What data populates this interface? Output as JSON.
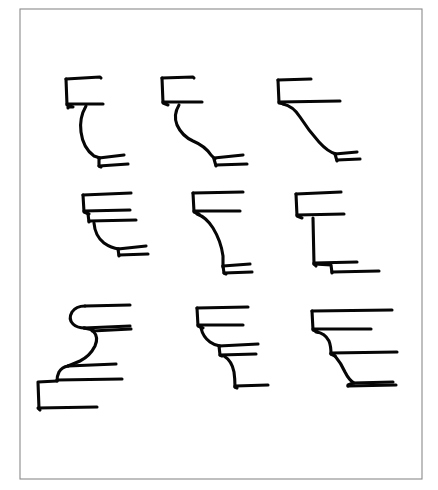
{
  "document": {
    "kind": "line-drawing-plate",
    "title": "",
    "background_color": "#ffffff",
    "ink_color": "#060606",
    "frame_color": "#8a8a8a"
  },
  "frame": {
    "x": 20,
    "y": 9,
    "width": 402,
    "height": 470,
    "stroke_width": 1.1,
    "label": "plate-border"
  },
  "plate": {
    "columns": 3,
    "rows": 3,
    "figure_count": 9,
    "subject": "architectural cornice and bracket moulding profiles",
    "caption": ""
  },
  "figures": [
    {
      "id": "profile-1",
      "row": 1,
      "column": 1,
      "name": "cavetto-cornice-profile",
      "label": "",
      "stroke_width": 3.1,
      "paths": [
        "M 66 79 L 67 105 L 73 107 L 68 107 L 68 108",
        "M 66 79 L 100 77 L 101 78",
        "M 67 104 L 103 104",
        "M 86 106 Q 79 118 81 132 Q 83 148 94 156 L 100 158",
        "M 99 158 L 124 155",
        "M 99 158 L 99 166 L 101 167",
        "M 99 166 L 128 164"
      ]
    },
    {
      "id": "profile-2",
      "row": 1,
      "column": 2,
      "name": "ogee-cornice-profile",
      "label": "",
      "stroke_width": 3.1,
      "paths": [
        "M 162 78 L 163 103 L 168 105",
        "M 162 78 L 193 77 L 194 78",
        "M 163 102 L 202 102",
        "M 179 105 Q 173 115 177 125 Q 182 136 193 141 Q 205 146 211 155 L 215 159",
        "M 214 158 L 243 155",
        "M 214 159 L 216 166",
        "M 216 165 L 247 164"
      ]
    },
    {
      "id": "profile-3",
      "row": 1,
      "column": 3,
      "name": "cyma-recta-cornice-profile",
      "label": "",
      "stroke_width": 3.1,
      "paths": [
        "M 278 80 L 279 103 L 284 104",
        "M 278 80 L 311 79",
        "M 279 102 L 340 101",
        "M 283 104 Q 293 106 300 117 Q 309 131 319 142 Q 328 152 336 154",
        "M 335 154 L 357 152",
        "M 335 154 L 337 161",
        "M 337 160 L 360 159"
      ]
    },
    {
      "id": "profile-4",
      "row": 2,
      "column": 1,
      "name": "stacked-fillet-cavetto-profile",
      "label": "",
      "stroke_width": 3.1,
      "paths": [
        "M 83 195 L 84 212 L 89 214",
        "M 83 195 L 131 193",
        "M 84 211 L 130 210",
        "M 88 214 L 89 222",
        "M 89 221 L 136 220",
        "M 94 223 Q 95 236 104 243 Q 111 248 119 249",
        "M 118 249 L 146 246",
        "M 118 249 L 119 256",
        "M 119 255 L 148 254"
      ]
    },
    {
      "id": "profile-5",
      "row": 2,
      "column": 2,
      "name": "scotia-bracket-profile",
      "label": "",
      "stroke_width": 3.1,
      "paths": [
        "M 193 193 L 194 212 L 199 214",
        "M 193 193 L 243 192",
        "M 194 211 L 240 211",
        "M 197 214 Q 206 217 213 228 Q 221 241 223 256 L 223 267",
        "M 223 266 L 250 264",
        "M 223 266 L 224 273 L 226 274",
        "M 224 273 L 252 272"
      ]
    },
    {
      "id": "profile-6",
      "row": 2,
      "column": 3,
      "name": "stepped-fascia-profile",
      "label": "",
      "stroke_width": 3.1,
      "paths": [
        "M 296 194 L 297 216 L 302 218",
        "M 296 194 L 341 192",
        "M 297 215 L 344 214",
        "M 313 218 L 314 264 L 316 266",
        "M 314 263 L 357 262",
        "M 314 264 L 331 265 L 332 273",
        "M 332 272 L 379 271"
      ]
    },
    {
      "id": "profile-7",
      "row": 3,
      "column": 1,
      "name": "double-ogee-base-profile",
      "label": "",
      "stroke_width": 3.1,
      "paths": [
        "M 85 306 Q 76 306 72 312 Q 68 319 73 324 Q 77 328 85 328",
        "M 85 306 L 130 305",
        "M 84 328 L 130 326",
        "M 84 328 L 93 330 L 94 331",
        "M 92 331 L 131 329",
        "M 93 331 Q 99 337 95 346 Q 90 356 80 361 Q 73 364 68 366",
        "M 68 366 L 116 364",
        "M 68 366 Q 62 367 59 372 Q 57 376 57 381",
        "M 57 380 L 122 379",
        "M 57 381 L 38 382 L 39 409",
        "M 38 408 L 97 407",
        "M 39 409 L 40 410"
      ]
    },
    {
      "id": "profile-8",
      "row": 3,
      "column": 2,
      "name": "triple-stepped-bracket-profile",
      "label": "",
      "stroke_width": 3.1,
      "paths": [
        "M 197 308 L 198 326 L 203 328",
        "M 197 308 L 248 307",
        "M 198 325 L 243 325",
        "M 201 328 Q 203 337 210 342 Q 214 345 220 346",
        "M 219 346 L 258 344",
        "M 219 346 L 220 355 L 222 356",
        "M 220 355 L 256 354",
        "M 224 356 Q 232 361 234 372 Q 235 379 235 387",
        "M 235 386 L 268 385",
        "M 235 387 L 237 388"
      ]
    },
    {
      "id": "profile-9",
      "row": 3,
      "column": 3,
      "name": "quirked-cavetto-stack-profile",
      "label": "",
      "stroke_width": 3.1,
      "paths": [
        "M 312 311 L 313 330 L 318 332",
        "M 312 311 L 392 310",
        "M 313 329 L 371 329",
        "M 316 332 Q 325 333 329 341 Q 331 346 331 354",
        "M 331 353 L 397 352",
        "M 331 354 L 335 356",
        "M 335 356 Q 341 363 345 372 Q 349 380 354 383",
        "M 353 383 L 393 382",
        "M 353 383 L 348 385 L 348 386",
        "M 348 386 L 396 385"
      ]
    }
  ]
}
